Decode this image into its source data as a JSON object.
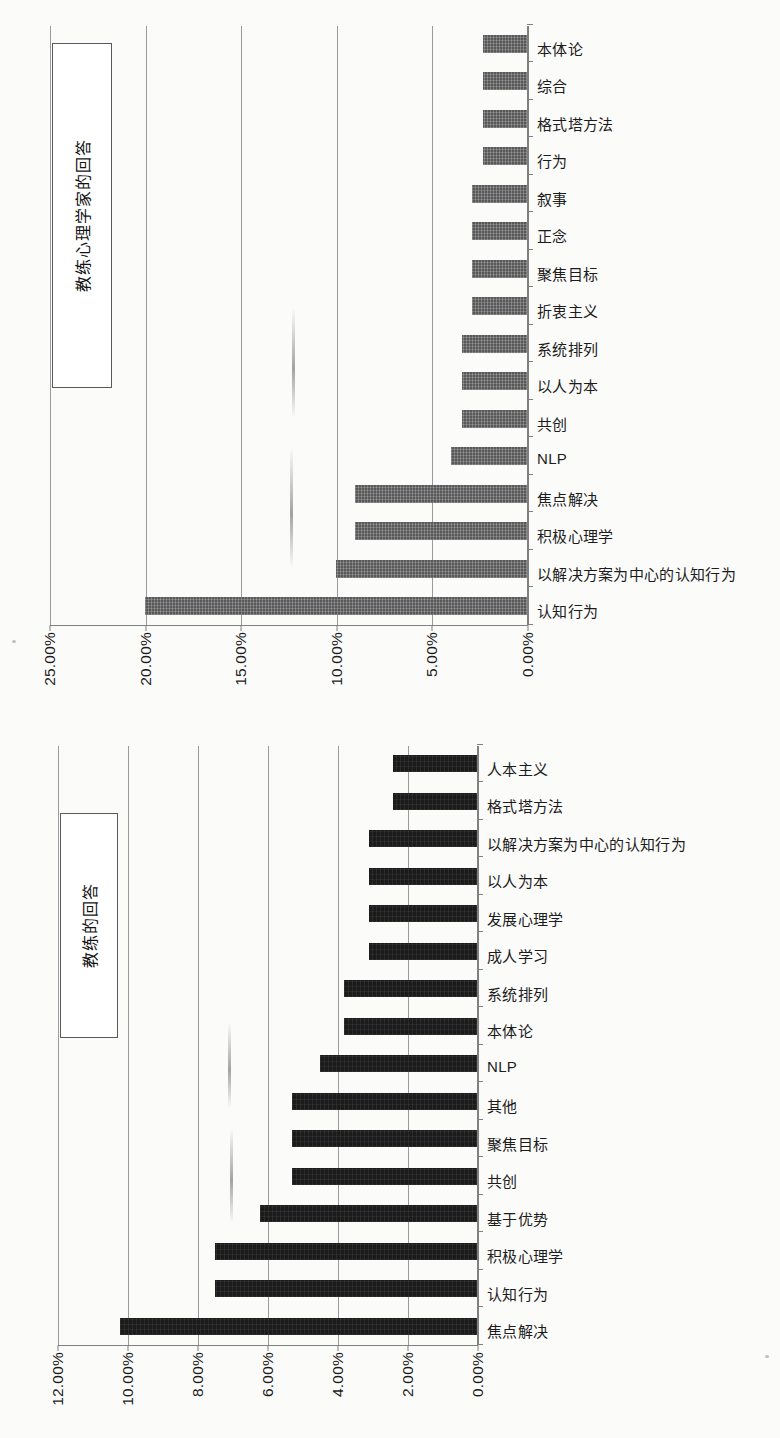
{
  "page": {
    "background_color": "#fbfbfa",
    "orientation_note": "both charts rotated 90 degrees",
    "ink_color": "#1b1b1b",
    "grid_color": "#9a9a9a"
  },
  "chart_data": [
    {
      "id": "coaching-psychologists",
      "type": "bar",
      "title": "教练心理学家的回答",
      "xlabel": "",
      "ylabel": "",
      "ylim": [
        0,
        25
      ],
      "yticks": [
        "0.00%",
        "5.00%",
        "10.00%",
        "15.00%",
        "20.00%",
        "25.00%"
      ],
      "ytick_values": [
        0,
        5,
        10,
        15,
        20,
        25
      ],
      "grid": true,
      "bar_color": "#585858",
      "legend": "none",
      "categories": [
        "认知行为",
        "以解决方案为中心的认知行为",
        "积极心理学",
        "焦点解决",
        "NLP",
        "共创",
        "以人为本",
        "系统排列",
        "折衷主义",
        "聚焦目标",
        "正念",
        "叙事",
        "行为",
        "格式塔方法",
        "综合",
        "本体论"
      ],
      "values": [
        20.0,
        10.0,
        9.0,
        9.0,
        4.0,
        3.4,
        3.4,
        3.4,
        2.9,
        2.9,
        2.9,
        2.9,
        2.3,
        2.3,
        2.3,
        2.3
      ]
    },
    {
      "id": "coaches",
      "type": "bar",
      "title": "教练的回答",
      "xlabel": "",
      "ylabel": "",
      "ylim": [
        0,
        12
      ],
      "yticks": [
        "0.00%",
        "2.00%",
        "4.00%",
        "6.00%",
        "8.00%",
        "10.00%",
        "12.00%"
      ],
      "ytick_values": [
        0,
        2,
        4,
        6,
        8,
        10,
        12
      ],
      "grid": true,
      "bar_color": "#1b1b1b",
      "legend": "none",
      "categories": [
        "焦点解决",
        "认知行为",
        "积极心理学",
        "基于优势",
        "共创",
        "聚焦目标",
        "其他",
        "NLP",
        "本体论",
        "系统排列",
        "成人学习",
        "发展心理学",
        "以人为本",
        "以解决方案为中心的认知行为",
        "格式塔方法",
        "人本主义"
      ],
      "values": [
        10.2,
        7.5,
        7.5,
        6.2,
        5.3,
        5.3,
        5.3,
        4.5,
        3.8,
        3.8,
        3.1,
        3.1,
        3.1,
        3.1,
        2.4,
        2.4
      ]
    }
  ]
}
